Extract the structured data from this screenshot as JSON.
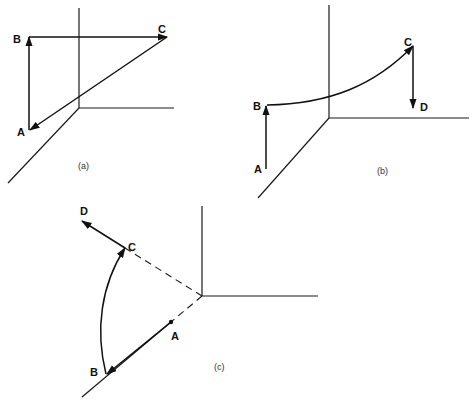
{
  "figure": {
    "panels": [
      {
        "id": "a",
        "caption": "(a)",
        "points": {
          "A": "A",
          "B": "B",
          "C": "C"
        },
        "vectors": [
          "A→B",
          "B→C",
          "C→A"
        ]
      },
      {
        "id": "b",
        "caption": "(b)",
        "points": {
          "A": "A",
          "B": "B",
          "C": "C",
          "D": "D"
        },
        "vectors": [
          "A→B",
          "B→C (curved)",
          "C→D"
        ]
      },
      {
        "id": "c",
        "caption": "(c)",
        "points": {
          "A": "A",
          "B": "B",
          "C": "C",
          "D": "D"
        },
        "vectors": [
          "A→B",
          "B→C (arc)",
          "C→D"
        ]
      }
    ]
  }
}
